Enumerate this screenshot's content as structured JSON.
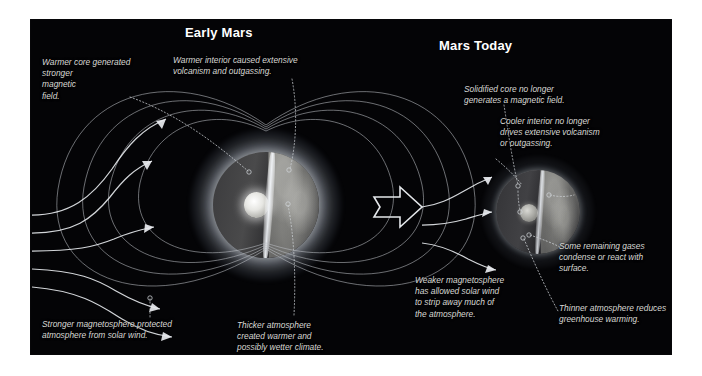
{
  "panels": {
    "left": {
      "title": "Early Mars",
      "callouts": {
        "warmer_core": "Warmer core generated\nstronger\nmagnetic\nfield.",
        "warmer_interior": "Warmer interior caused extensive\nvolcanism and outgassing.",
        "stronger_magnetosphere": "Stronger magnetosphere protected\natmosphere from solar wind.",
        "thicker_atmosphere": "Thicker atmosphere\ncreated warmer and\npossibly wetter climate."
      }
    },
    "right": {
      "title": "Mars Today",
      "callouts": {
        "solidified_core": "Solidified core no longer\ngenerates a magnetic field.",
        "cooler_interior": "Cooler interior no longer\ndrives extensive volcanism\nor outgassing.",
        "remaining_gases": "Some remaining gases\ncondense or react with\nsurface.",
        "weaker_magnetosphere": "Weaker magnetosphere\nhas allowed solar wind\nto strip away much of\nthe atmosphere.",
        "thinner_atmosphere": "Thinner atmosphere reduces\ngreenhouse warming."
      }
    }
  },
  "transition_arrow": "right-arrow",
  "colors": {
    "background": "#040406",
    "page": "#ffffff",
    "title_text": "#ffffff",
    "callout_text": "#d8d8d4",
    "field_line": "#b9bcc2",
    "solar_wind": "#e9ecf0",
    "leader_line": "#cfd2d6"
  }
}
